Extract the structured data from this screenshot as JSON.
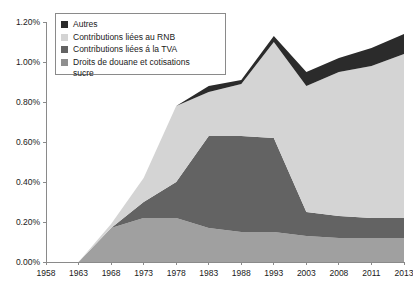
{
  "chart_data": {
    "type": "area",
    "stacked": true,
    "title": "",
    "xlabel": "",
    "ylabel": "",
    "grid": false,
    "legend_position": "top-left",
    "categories": [
      "1958",
      "1963",
      "1968",
      "1973",
      "1978",
      "1983",
      "1988",
      "1993",
      "2003",
      "2008",
      "2011",
      "2013"
    ],
    "x": [
      1958,
      1963,
      1968,
      1973,
      1978,
      1983,
      1988,
      1993,
      2003,
      2008,
      2011,
      2013
    ],
    "ylim": [
      0.0,
      1.2
    ],
    "yticks": [
      0.0,
      0.2,
      0.4,
      0.6,
      0.8,
      1.0,
      1.2
    ],
    "ytick_labels": [
      "0.00%",
      "0.20%",
      "0.40%",
      "0.60%",
      "0.80%",
      "1.00%",
      "1.20%"
    ],
    "xtick_labels": [
      "1958",
      "1963",
      "1968",
      "1973",
      "1978",
      "1983",
      "1988",
      "1993",
      "2003",
      "2008",
      "2011",
      "2013"
    ],
    "value_unit": "%",
    "series": [
      {
        "name": "Droits de douane et cotisations sucre",
        "color": "#a0a0a0",
        "values": [
          0.0,
          0.0,
          0.17,
          0.22,
          0.22,
          0.17,
          0.15,
          0.15,
          0.13,
          0.12,
          0.12,
          0.12
        ]
      },
      {
        "name": "Contributions liées á la TVA",
        "color": "#636363",
        "values": [
          0.0,
          0.0,
          0.0,
          0.08,
          0.18,
          0.46,
          0.48,
          0.47,
          0.12,
          0.11,
          0.1,
          0.1
        ]
      },
      {
        "name": "Contributions liées au RNB",
        "color": "#d4d4d4",
        "values": [
          0.0,
          0.0,
          0.02,
          0.12,
          0.38,
          0.22,
          0.26,
          0.48,
          0.63,
          0.72,
          0.76,
          0.82
        ]
      },
      {
        "name": "Autres",
        "color": "#2b2b2b",
        "values": [
          0.0,
          0.0,
          0.0,
          0.0,
          0.0,
          0.03,
          0.02,
          0.03,
          0.07,
          0.07,
          0.09,
          0.1
        ]
      }
    ],
    "totals": [
      0.0,
      0.0,
      0.19,
      0.42,
      0.78,
      0.88,
      0.91,
      1.13,
      0.95,
      1.02,
      1.07,
      1.14
    ]
  },
  "legend": {
    "items": [
      {
        "label": "Autres",
        "color": "#2b2b2b"
      },
      {
        "label": "Contributions liées au RNB",
        "color": "#d4d4d4"
      },
      {
        "label": "Contributions liées á la TVA",
        "color": "#636363"
      },
      {
        "label": "Droits de douane et cotisations\nsucre",
        "color": "#8f8f8f"
      }
    ]
  },
  "axis_color": "#8a8a8a"
}
